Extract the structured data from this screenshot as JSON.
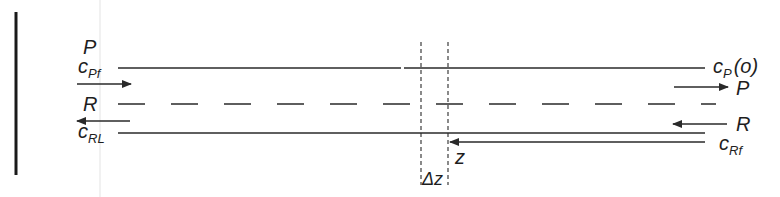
{
  "diagram": {
    "type": "counter-current flow schematic",
    "colors": {
      "line": "#2a2a2a",
      "faint_guide": "#e6e6e6",
      "background": "#ffffff"
    },
    "left": {
      "stream_P_label": "P",
      "c_Pf": {
        "base": "c",
        "sub": "Pf"
      },
      "stream_R_label": "R",
      "c_RL": {
        "base": "c",
        "sub": "RL"
      }
    },
    "right": {
      "c_P_o": {
        "base": "c",
        "sub": "P",
        "arg": "(o)"
      },
      "stream_P_label": "P",
      "stream_R_label": "R",
      "c_Rf": {
        "base": "c",
        "sub": "Rf"
      }
    },
    "element": {
      "z_label": "z",
      "delta_z_label": "Δz"
    }
  }
}
